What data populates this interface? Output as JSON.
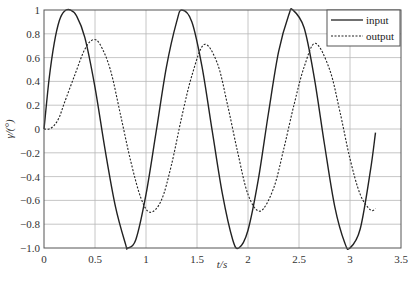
{
  "chart_data": {
    "type": "line",
    "title": "",
    "xlabel": "t/s",
    "ylabel": "γ/(°)",
    "xlim": [
      0,
      3.5
    ],
    "ylim": [
      -1.0,
      1.0
    ],
    "grid": true,
    "legend_position": "upper right",
    "x_ticks": [
      "0",
      "0.5",
      "1",
      "1.5",
      "2",
      "2.5",
      "3",
      "3.5"
    ],
    "y_ticks": [
      "1",
      "0.8",
      "0.6",
      "0.4",
      "0.2",
      "0",
      "-0.2",
      "-0.4",
      "-0.6",
      "-0.8",
      "-1.0"
    ],
    "series": [
      {
        "name": "input",
        "style": "solid",
        "color": "#222222",
        "x": [
          0,
          0.05,
          0.1,
          0.15,
          0.2,
          0.26,
          0.32,
          0.4,
          0.5,
          0.6,
          0.7,
          0.8,
          0.82,
          0.9,
          1.0,
          1.1,
          1.2,
          1.3,
          1.35,
          1.45,
          1.55,
          1.65,
          1.75,
          1.85,
          1.91,
          2.0,
          2.1,
          2.2,
          2.3,
          2.4,
          2.44,
          2.55,
          2.65,
          2.75,
          2.85,
          2.95,
          3.0,
          3.1,
          3.2,
          3.25
        ],
        "values": [
          0,
          0.42,
          0.72,
          0.91,
          0.99,
          1.0,
          0.95,
          0.77,
          0.35,
          -0.18,
          -0.65,
          -0.97,
          -1.0,
          -0.93,
          -0.55,
          -0.02,
          0.52,
          0.9,
          1.0,
          0.9,
          0.52,
          -0.02,
          -0.55,
          -0.93,
          -1.0,
          -0.85,
          -0.43,
          0.13,
          0.65,
          0.96,
          1.0,
          0.85,
          0.43,
          -0.13,
          -0.65,
          -0.96,
          -1.0,
          -0.84,
          -0.35,
          -0.03
        ]
      },
      {
        "name": "output",
        "style": "dashed",
        "color": "#222222",
        "x": [
          0,
          0.05,
          0.1,
          0.15,
          0.2,
          0.3,
          0.4,
          0.48,
          0.55,
          0.65,
          0.75,
          0.85,
          0.95,
          1.04,
          1.15,
          1.25,
          1.35,
          1.45,
          1.57,
          1.7,
          1.8,
          1.9,
          2.0,
          2.12,
          2.25,
          2.35,
          2.45,
          2.55,
          2.66,
          2.8,
          2.9,
          3.0,
          3.1,
          3.2,
          3.25
        ],
        "values": [
          0,
          0.0,
          0.03,
          0.1,
          0.22,
          0.45,
          0.67,
          0.75,
          0.71,
          0.5,
          0.12,
          -0.27,
          -0.58,
          -0.7,
          -0.6,
          -0.3,
          0.1,
          0.45,
          0.71,
          0.55,
          0.2,
          -0.2,
          -0.55,
          -0.69,
          -0.5,
          -0.17,
          0.2,
          0.52,
          0.72,
          0.5,
          0.15,
          -0.25,
          -0.55,
          -0.68,
          -0.67
        ]
      }
    ]
  },
  "legend": {
    "items": [
      {
        "label": "input",
        "style": "solid"
      },
      {
        "label": "output",
        "style": "dashed"
      }
    ]
  },
  "axes": {
    "xlabel": "t/s",
    "ylabel": "γ/(°)"
  }
}
